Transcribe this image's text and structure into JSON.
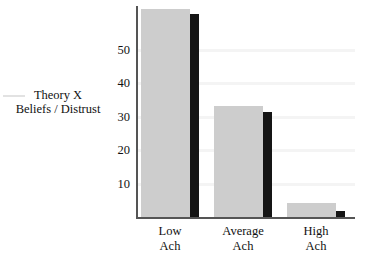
{
  "chart_data": {
    "type": "bar",
    "title": "",
    "xlabel": "",
    "ylabel": "Theory X Beliefs / Distrust",
    "ylabel_lines": [
      "Theory X",
      "Beliefs / Distrust"
    ],
    "categories": [
      "Low Ach",
      "Average Ach",
      "High Ach"
    ],
    "category_lines": [
      [
        "Low",
        "Ach"
      ],
      [
        "Average",
        "Ach"
      ],
      [
        "High",
        "Ach"
      ]
    ],
    "ylim": [
      0,
      63
    ],
    "yticks": [
      10,
      20,
      30,
      40,
      50
    ],
    "ytick_labels": [
      "10",
      "20",
      "30",
      "40",
      "50"
    ],
    "grid": true,
    "legend": "none",
    "series": [
      {
        "name": "gray-series",
        "color": "#cdcdcd",
        "values": [
          62,
          33,
          4.2
        ]
      },
      {
        "name": "black-series",
        "color": "#151515",
        "values": [
          60.5,
          31.5,
          1.8
        ]
      }
    ]
  },
  "colors": {
    "background": "#ffffff",
    "axis": "#555555",
    "grid": "#f4f4f4",
    "text": "#111111",
    "bar_gray": "#cdcdcd",
    "bar_black": "#151515"
  }
}
